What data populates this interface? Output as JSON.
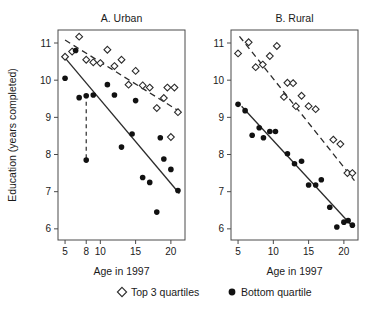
{
  "figure": {
    "ylabel": "Education (years completed)",
    "legend": [
      {
        "marker": "diamond-open-icon",
        "label": "Top 3 quartiles"
      },
      {
        "marker": "circle-filled-icon",
        "label": "Bottom quartile"
      }
    ]
  },
  "chart_data": [
    {
      "type": "scatter",
      "title": "A. Urban",
      "xlabel": "Age in 1997",
      "ylabel": "Education (years completed)",
      "xlim": [
        4,
        22
      ],
      "ylim": [
        5.7,
        11.35
      ],
      "xticks": [
        5,
        8,
        10,
        15,
        20
      ],
      "yticks": [
        6,
        7,
        8,
        9,
        10,
        11
      ],
      "grid": false,
      "legend_position": "below-figure",
      "series": [
        {
          "name": "Top 3 quartiles",
          "marker": "diamond-open",
          "points": [
            {
              "x": 5.0,
              "y": 10.63
            },
            {
              "x": 6.0,
              "y": 10.77
            },
            {
              "x": 7.0,
              "y": 11.17
            },
            {
              "x": 8.0,
              "y": 10.55
            },
            {
              "x": 9.0,
              "y": 10.48
            },
            {
              "x": 10.0,
              "y": 10.46
            },
            {
              "x": 11.0,
              "y": 10.82
            },
            {
              "x": 12.0,
              "y": 10.38
            },
            {
              "x": 13.0,
              "y": 10.55
            },
            {
              "x": 14.0,
              "y": 9.88
            },
            {
              "x": 15.0,
              "y": 10.25
            },
            {
              "x": 16.0,
              "y": 9.86
            },
            {
              "x": 17.0,
              "y": 9.8
            },
            {
              "x": 18.0,
              "y": 9.25
            },
            {
              "x": 19.0,
              "y": 9.52
            },
            {
              "x": 19.5,
              "y": 9.8
            },
            {
              "x": 20.5,
              "y": 9.8
            },
            {
              "x": 21.0,
              "y": 9.14
            },
            {
              "x": 20.0,
              "y": 8.47
            }
          ]
        },
        {
          "name": "Bottom quartile",
          "marker": "circle-filled",
          "points": [
            {
              "x": 5.0,
              "y": 10.05
            },
            {
              "x": 6.5,
              "y": 10.8
            },
            {
              "x": 7.0,
              "y": 9.53
            },
            {
              "x": 8.0,
              "y": 9.58
            },
            {
              "x": 9.0,
              "y": 9.6
            },
            {
              "x": 11.0,
              "y": 9.88
            },
            {
              "x": 12.0,
              "y": 9.6
            },
            {
              "x": 15.0,
              "y": 9.45
            },
            {
              "x": 8.0,
              "y": 7.85
            },
            {
              "x": 13.0,
              "y": 8.2
            },
            {
              "x": 14.5,
              "y": 8.55
            },
            {
              "x": 16.0,
              "y": 7.38
            },
            {
              "x": 17.0,
              "y": 7.25
            },
            {
              "x": 18.0,
              "y": 6.45
            },
            {
              "x": 19.0,
              "y": 7.88
            },
            {
              "x": 20.0,
              "y": 7.6
            },
            {
              "x": 21.0,
              "y": 7.03
            },
            {
              "x": 18.5,
              "y": 8.45
            }
          ]
        }
      ],
      "fits": [
        {
          "name": "Top 3 quartiles fit",
          "style": "dashed",
          "x0": 5.0,
          "y0": 11.08,
          "x1": 21.3,
          "y1": 9.15
        },
        {
          "name": "Bottom quartile fit",
          "style": "solid",
          "x0": 5.0,
          "y0": 10.6,
          "x1": 21.2,
          "y1": 6.95
        }
      ],
      "annotations": [
        {
          "name": "outlier-drop-line",
          "style": "vertical-dashed",
          "x": 8.0,
          "y_top": 9.62,
          "y_bottom": 7.85
        }
      ]
    },
    {
      "type": "scatter",
      "title": "B. Rural",
      "xlabel": "Age in 1997",
      "ylabel": "Education (years completed)",
      "xlim": [
        4,
        22
      ],
      "ylim": [
        5.7,
        11.35
      ],
      "xticks": [
        5,
        10,
        15,
        20
      ],
      "yticks": [
        6,
        7,
        8,
        9,
        10,
        11
      ],
      "grid": false,
      "legend_position": "below-figure",
      "series": [
        {
          "name": "Top 3 quartiles",
          "marker": "diamond-open",
          "points": [
            {
              "x": 5.0,
              "y": 10.72
            },
            {
              "x": 6.5,
              "y": 11.02
            },
            {
              "x": 7.5,
              "y": 10.35
            },
            {
              "x": 8.5,
              "y": 10.42
            },
            {
              "x": 9.5,
              "y": 10.65
            },
            {
              "x": 10.5,
              "y": 10.92
            },
            {
              "x": 12.0,
              "y": 9.93
            },
            {
              "x": 12.8,
              "y": 9.92
            },
            {
              "x": 11.5,
              "y": 9.55
            },
            {
              "x": 14.0,
              "y": 9.58
            },
            {
              "x": 15.0,
              "y": 9.3
            },
            {
              "x": 16.0,
              "y": 9.22
            },
            {
              "x": 13.2,
              "y": 9.3
            },
            {
              "x": 18.5,
              "y": 8.4
            },
            {
              "x": 19.5,
              "y": 8.28
            },
            {
              "x": 20.5,
              "y": 7.5
            },
            {
              "x": 21.2,
              "y": 7.5
            }
          ]
        },
        {
          "name": "Bottom quartile",
          "marker": "circle-filled",
          "points": [
            {
              "x": 5.0,
              "y": 9.35
            },
            {
              "x": 6.0,
              "y": 9.18
            },
            {
              "x": 7.0,
              "y": 8.52
            },
            {
              "x": 8.0,
              "y": 8.72
            },
            {
              "x": 8.6,
              "y": 8.45
            },
            {
              "x": 9.5,
              "y": 8.62
            },
            {
              "x": 10.3,
              "y": 8.62
            },
            {
              "x": 12.0,
              "y": 8.02
            },
            {
              "x": 13.0,
              "y": 7.75
            },
            {
              "x": 14.0,
              "y": 7.82
            },
            {
              "x": 15.0,
              "y": 7.18
            },
            {
              "x": 16.0,
              "y": 7.18
            },
            {
              "x": 16.8,
              "y": 7.32
            },
            {
              "x": 18.0,
              "y": 6.58
            },
            {
              "x": 19.0,
              "y": 6.05
            },
            {
              "x": 20.0,
              "y": 6.18
            },
            {
              "x": 20.6,
              "y": 6.22
            },
            {
              "x": 21.2,
              "y": 6.1
            }
          ]
        }
      ],
      "fits": [
        {
          "name": "Top 3 quartiles fit",
          "style": "dashed",
          "x0": 5.2,
          "y0": 11.18,
          "x1": 21.5,
          "y1": 7.3
        },
        {
          "name": "Bottom quartile fit",
          "style": "solid",
          "x0": 5.5,
          "y0": 9.3,
          "x1": 21.3,
          "y1": 6.05
        }
      ],
      "annotations": []
    }
  ]
}
